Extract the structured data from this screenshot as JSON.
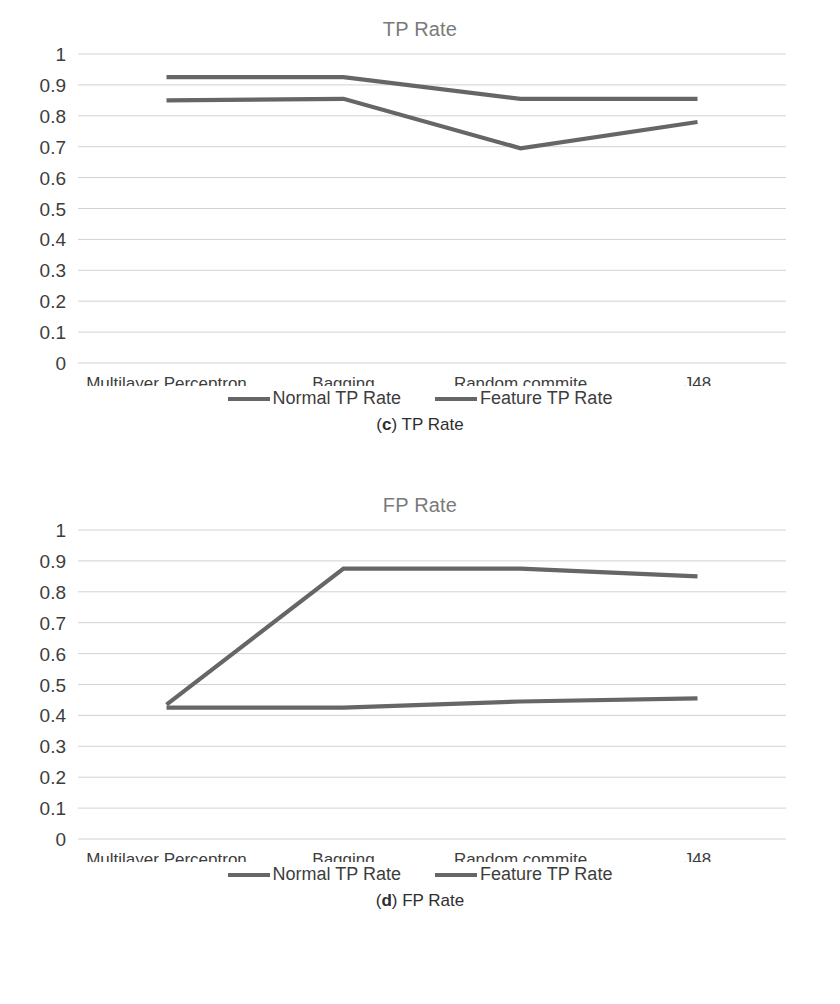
{
  "figures": [
    {
      "id": "tp",
      "title": "TP Rate",
      "caption_tag": "c",
      "caption_text": ") TP Rate",
      "legend": [
        {
          "label": "Normal TP Rate",
          "color": "#666666"
        },
        {
          "label": "Feature TP Rate",
          "color": "#666666"
        }
      ]
    },
    {
      "id": "fp",
      "title": "FP Rate",
      "caption_tag": "d",
      "caption_text": ") FP Rate",
      "legend": [
        {
          "label": "Normal TP Rate",
          "color": "#666666"
        },
        {
          "label": "Feature TP Rate",
          "color": "#666666"
        }
      ]
    }
  ],
  "chart_data": [
    {
      "type": "line",
      "title": "TP Rate",
      "xlabel": "",
      "ylabel": "",
      "ylim": [
        0,
        1
      ],
      "yticks": [
        0,
        0.1,
        0.2,
        0.3,
        0.4,
        0.5,
        0.6,
        0.7,
        0.8,
        0.9,
        1
      ],
      "ytick_labels": [
        "0",
        "0.1",
        "0.2",
        "0.3",
        "0.4",
        "0.5",
        "0.6",
        "0.7",
        "0.8",
        "0.9",
        "1"
      ],
      "categories": [
        "Multilayer Perceptron",
        "Bagging",
        "Random commite",
        "J48"
      ],
      "grid": true,
      "legend_position": "bottom",
      "series": [
        {
          "name": "Normal TP Rate",
          "color": "#666666",
          "values": [
            0.85,
            0.855,
            0.695,
            0.78
          ]
        },
        {
          "name": "Feature TP Rate",
          "color": "#666666",
          "values": [
            0.925,
            0.925,
            0.855,
            0.855
          ]
        }
      ]
    },
    {
      "type": "line",
      "title": "FP Rate",
      "xlabel": "",
      "ylabel": "",
      "ylim": [
        0,
        1
      ],
      "yticks": [
        0,
        0.1,
        0.2,
        0.3,
        0.4,
        0.5,
        0.6,
        0.7,
        0.8,
        0.9,
        1
      ],
      "ytick_labels": [
        "0",
        "0.1",
        "0.2",
        "0.3",
        "0.4",
        "0.5",
        "0.6",
        "0.7",
        "0.8",
        "0.9",
        "1"
      ],
      "categories": [
        "Multilayer Perceptron",
        "Bagging",
        "Random commite",
        "J48"
      ],
      "grid": true,
      "legend_position": "bottom",
      "series": [
        {
          "name": "Normal TP Rate",
          "color": "#666666",
          "values": [
            0.435,
            0.875,
            0.875,
            0.85
          ]
        },
        {
          "name": "Feature TP Rate",
          "color": "#666666",
          "values": [
            0.425,
            0.425,
            0.445,
            0.455
          ]
        }
      ]
    }
  ]
}
